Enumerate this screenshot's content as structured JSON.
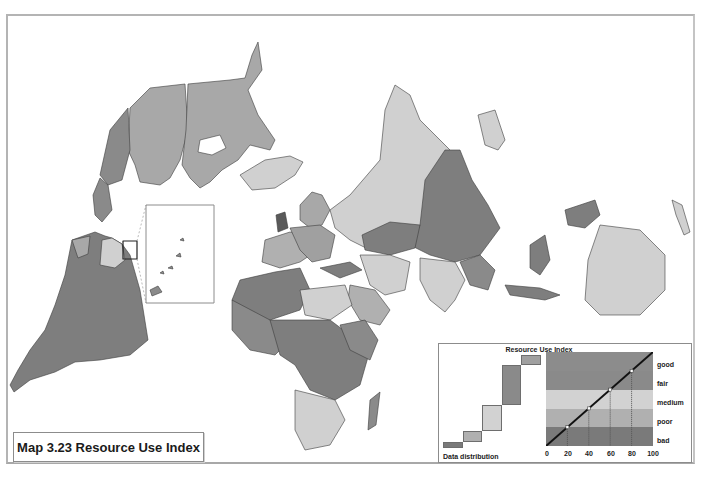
{
  "map": {
    "title": "Map 3.23 Resource Use Index",
    "colors": {
      "good": "#8c8c8c",
      "fair": "#8a8a8a",
      "medium": "#d2d2d2",
      "poor": "#b0b0b0",
      "bad": "#7a7a7a",
      "border": "#3c3c3c",
      "ocean": "#ffffff"
    },
    "inset": {
      "description": "Caribbean islands inset"
    }
  },
  "legend": {
    "title": "Resource Use Index",
    "distribution_label": "Data distribution",
    "classes": [
      {
        "label": "good",
        "range": [
          80,
          100
        ]
      },
      {
        "label": "fair",
        "range": [
          60,
          80
        ]
      },
      {
        "label": "medium",
        "range": [
          40,
          60
        ]
      },
      {
        "label": "poor",
        "range": [
          20,
          40
        ]
      },
      {
        "label": "bad",
        "range": [
          0,
          20
        ]
      }
    ],
    "x_ticks": [
      "0",
      "20",
      "40",
      "60",
      "80",
      "100"
    ],
    "breakpoints": [
      20,
      40,
      60,
      80
    ]
  }
}
